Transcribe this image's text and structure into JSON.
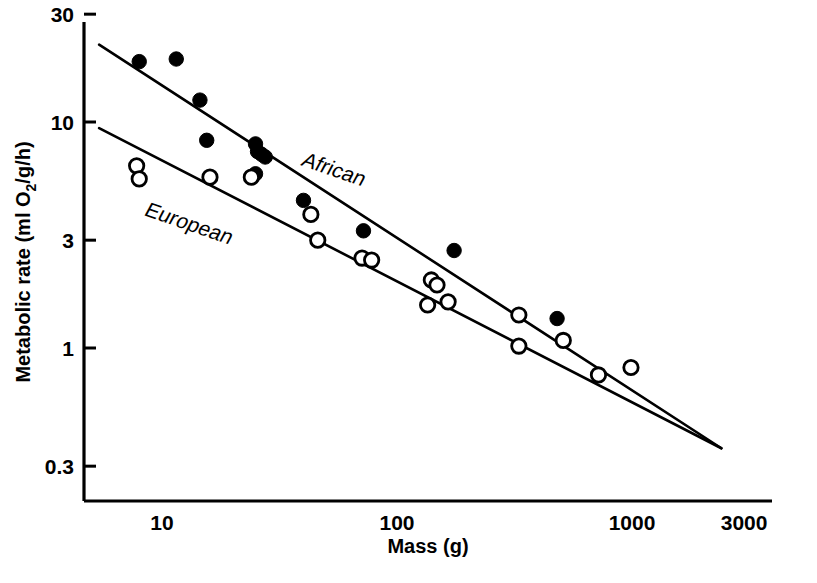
{
  "chart_data": {
    "type": "scatter",
    "title": "",
    "xlabel": "Mass (g)",
    "ylabel": "Metabolic rate (ml O2/g/h)",
    "ylabel_parts": {
      "pre": "Metabolic rate (ml O",
      "sub": "2",
      "post": "/g/h)"
    },
    "xscale": "log",
    "yscale": "log",
    "xlim": [
      5,
      3000
    ],
    "ylim": [
      0.25,
      36
    ],
    "grid": false,
    "legend_position": "inline-line-labels",
    "xticks": [
      {
        "value": 10,
        "label": "10"
      },
      {
        "value": 100,
        "label": "100"
      },
      {
        "value": 1000,
        "label": "1000"
      },
      {
        "value": 3000,
        "label": "3000"
      }
    ],
    "yticks": [
      {
        "value": 30,
        "label": "30"
      },
      {
        "value": 10,
        "label": "10"
      },
      {
        "value": 3,
        "label": "3"
      },
      {
        "value": 1,
        "label": "1"
      },
      {
        "value": 0.3,
        "label": "0.3"
      }
    ],
    "series": [
      {
        "name": "African",
        "marker": "filled-circle",
        "color": "#000000",
        "annotation": "African",
        "points": [
          {
            "x": 8.0,
            "y": 18.5
          },
          {
            "x": 11.5,
            "y": 19.0
          },
          {
            "x": 14.5,
            "y": 12.5
          },
          {
            "x": 15.5,
            "y": 8.3
          },
          {
            "x": 25.0,
            "y": 8.0
          },
          {
            "x": 25.5,
            "y": 7.4
          },
          {
            "x": 26.5,
            "y": 7.2
          },
          {
            "x": 27.5,
            "y": 7.0
          },
          {
            "x": 25.0,
            "y": 5.9
          },
          {
            "x": 40.0,
            "y": 4.5
          },
          {
            "x": 72.0,
            "y": 3.3
          },
          {
            "x": 175.0,
            "y": 2.7
          },
          {
            "x": 480.0,
            "y": 1.35
          }
        ],
        "fit_line": {
          "x_start": 5.4,
          "y_start": 22.0,
          "x_end": 2400,
          "y_end": 0.36
        }
      },
      {
        "name": "European",
        "marker": "open-circle",
        "color": "#000000",
        "annotation": "European",
        "points": [
          {
            "x": 7.8,
            "y": 6.4
          },
          {
            "x": 8.0,
            "y": 5.6
          },
          {
            "x": 16.0,
            "y": 5.7
          },
          {
            "x": 24.0,
            "y": 5.7
          },
          {
            "x": 43.0,
            "y": 3.9
          },
          {
            "x": 46.0,
            "y": 3.0
          },
          {
            "x": 71.0,
            "y": 2.5
          },
          {
            "x": 78.0,
            "y": 2.45
          },
          {
            "x": 140.0,
            "y": 2.0
          },
          {
            "x": 148.0,
            "y": 1.9
          },
          {
            "x": 135.0,
            "y": 1.55
          },
          {
            "x": 165.0,
            "y": 1.6
          },
          {
            "x": 330.0,
            "y": 1.4
          },
          {
            "x": 330.0,
            "y": 1.02
          },
          {
            "x": 510.0,
            "y": 1.08
          },
          {
            "x": 720.0,
            "y": 0.76
          },
          {
            "x": 990.0,
            "y": 0.82
          }
        ],
        "fit_line": {
          "x_start": 5.4,
          "y_start": 9.4,
          "x_end": 2400,
          "y_end": 0.36
        }
      }
    ]
  }
}
